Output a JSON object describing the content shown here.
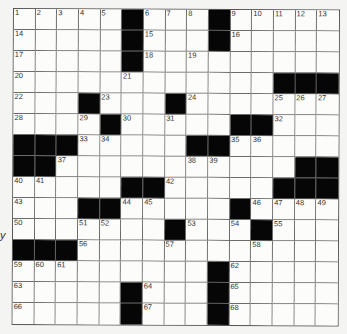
{
  "puzzle": {
    "rows": 15,
    "cols": 15,
    "grid": [
      [
        "1",
        "2",
        "3",
        "4",
        "5",
        "#",
        "6",
        "7",
        "8",
        "#",
        "9",
        "10",
        "11",
        "12",
        "13"
      ],
      [
        "14",
        ".",
        ".",
        ".",
        ".",
        "#",
        "15",
        ".",
        ".",
        "#",
        "16",
        ".",
        ".",
        ".",
        "."
      ],
      [
        "17",
        ".",
        ".",
        ".",
        ".",
        "#",
        "18",
        ".",
        "19",
        ".",
        ".",
        ".",
        ".",
        ".",
        "."
      ],
      [
        "20",
        ".",
        ".",
        ".",
        ".",
        "21",
        ".",
        ".",
        ".",
        ".",
        ".",
        ".",
        "#",
        "#",
        "#"
      ],
      [
        "22",
        ".",
        ".",
        "#",
        "23",
        ".",
        ".",
        "#",
        "24",
        ".",
        ".",
        ".",
        "25",
        "26",
        "27"
      ],
      [
        "28",
        ".",
        ".",
        "29",
        "#",
        "30",
        ".",
        "31",
        ".",
        ".",
        "#",
        "#",
        "32",
        ".",
        "."
      ],
      [
        "#",
        "#",
        "#",
        "33",
        "34",
        ".",
        ".",
        ".",
        "#",
        "#",
        "35",
        "36",
        ".",
        ".",
        "."
      ],
      [
        "#",
        "#",
        "37",
        ".",
        ".",
        ".",
        ".",
        ".",
        "38",
        "39",
        ".",
        ".",
        ".",
        "#",
        "#"
      ],
      [
        "40",
        "41",
        ".",
        ".",
        ".",
        "#",
        "#",
        "42",
        ".",
        ".",
        ".",
        ".",
        "#",
        "#",
        "#"
      ],
      [
        "43",
        ".",
        ".",
        "#",
        "#",
        "44",
        "45",
        ".",
        ".",
        ".",
        "#",
        "46",
        "47",
        "48",
        "49"
      ],
      [
        "50",
        ".",
        ".",
        "51",
        "52",
        ".",
        ".",
        "#",
        "53",
        ".",
        "54",
        "#",
        "55",
        ".",
        "."
      ],
      [
        "#",
        "#",
        "#",
        "56",
        ".",
        ".",
        ".",
        "57",
        ".",
        ".",
        ".",
        "58",
        ".",
        ".",
        "."
      ],
      [
        "59",
        "60",
        "61",
        ".",
        ".",
        ".",
        ".",
        ".",
        ".",
        "#",
        "62",
        ".",
        ".",
        ".",
        "."
      ],
      [
        "63",
        ".",
        ".",
        ".",
        ".",
        "#",
        "64",
        ".",
        ".",
        "#",
        "65",
        ".",
        ".",
        ".",
        "."
      ],
      [
        "66",
        ".",
        ".",
        ".",
        ".",
        "#",
        "67",
        ".",
        ".",
        "#",
        "68",
        ".",
        ".",
        ".",
        "."
      ]
    ],
    "legend": {
      "#": "black-square",
      ".": "empty-square",
      "number": "numbered-square"
    }
  },
  "margin_text": "y"
}
